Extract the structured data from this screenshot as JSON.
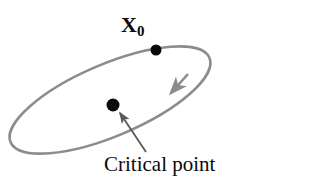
{
  "figure": {
    "background_color": "#ffffff",
    "orbit": {
      "name": "closed-orbit-ellipse",
      "shape": "ellipse",
      "stroke_color": "#8c8c8c",
      "stroke_width": 2.6,
      "center": [
        110,
        100
      ],
      "radius_x": 108,
      "radius_y": 36,
      "rotation_deg": -23,
      "direction": "clockwise"
    },
    "direction_arrow": {
      "name": "orbit-direction-arrow",
      "color": "#8c8c8c",
      "tip": [
        169,
        95
      ],
      "heading_deg": 215
    },
    "points": [
      {
        "name": "initial-condition-point",
        "label": "X",
        "label_subscript": "0",
        "color": "#0a0a0a",
        "radius": 5.5,
        "position": [
          156,
          50
        ],
        "label_position": [
          121,
          14
        ]
      },
      {
        "name": "critical-point",
        "label": "Critical point",
        "color": "#0a0a0a",
        "radius": 6.5,
        "position": [
          113,
          105
        ],
        "label_position": [
          104,
          154
        ]
      }
    ],
    "leader_line": {
      "name": "critical-point-leader",
      "color": "#5a5a5a",
      "stroke_width": 1.8,
      "from": [
        146,
        152
      ],
      "to": [
        119,
        112
      ],
      "arrow_at": "to"
    }
  },
  "labels": {
    "x0_base": "X",
    "x0_sub": "0",
    "critical_point": "Critical point"
  }
}
